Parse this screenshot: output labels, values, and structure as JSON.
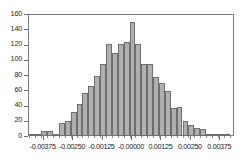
{
  "chart_data": {
    "type": "bar",
    "title": "",
    "subtitle": "",
    "xlabel": "",
    "ylabel": "",
    "xlim": [
      -0.004375,
      0.004375
    ],
    "ylim": [
      0,
      160
    ],
    "grid": false,
    "legend": null,
    "bar_color": "#b0b0b0",
    "bar_edge_color": "#6e6e6e",
    "axis_color": "#7a7a7a",
    "text_color": "#1a1a1a",
    "background": "#ffffff",
    "y_ticks": [
      0,
      20,
      40,
      60,
      80,
      100,
      120,
      140,
      160
    ],
    "y_tick_labels": [
      "0",
      "20",
      "40",
      "60",
      "80",
      "100",
      "120",
      "140",
      "160"
    ],
    "x_ticks": [
      -0.00375,
      -0.0025,
      -0.00125,
      -0.0,
      0.00125,
      0.0025,
      0.00375
    ],
    "x_tick_labels": [
      "-0.00375",
      "-0.00250",
      "-0.00125",
      "-0.00000",
      "0.00125",
      "0.00250",
      "0.00375"
    ],
    "bin_width": 0.00025,
    "bin_centers": [
      -0.0041875,
      -0.0039375,
      -0.0036875,
      -0.0034375,
      -0.0031875,
      -0.0029375,
      -0.0026875,
      -0.0024375,
      -0.0021875,
      -0.0019375,
      -0.0016875,
      -0.0014375,
      -0.0011875,
      -0.0009375,
      -0.0006875,
      -0.0004375,
      -0.0001875,
      6.25e-05,
      0.0003125,
      0.0005625,
      0.0008125,
      0.0010625,
      0.0013125,
      0.0015625,
      0.0018125,
      0.0020625,
      0.0023125,
      0.0025625,
      0.0028125,
      0.0030625,
      0.0033125,
      0.0035625,
      0.0038125,
      0.0040625
    ],
    "categories": [
      "-0.0041875",
      "-0.0039375",
      "-0.0036875",
      "-0.0034375",
      "-0.0031875",
      "-0.0029375",
      "-0.0026875",
      "-0.0024375",
      "-0.0021875",
      "-0.0019375",
      "-0.0016875",
      "-0.0014375",
      "-0.0011875",
      "-0.0009375",
      "-0.0006875",
      "-0.0004375",
      "-0.0001875",
      "0.0000625",
      "0.0003125",
      "0.0005625",
      "0.0008125",
      "0.0010625",
      "0.0013125",
      "0.0015625",
      "0.0018125",
      "0.0020625",
      "0.0023125",
      "0.0025625",
      "0.0028125",
      "0.0030625",
      "0.0033125",
      "0.0035625",
      "0.0038125",
      "0.0040625"
    ],
    "values": [
      1,
      1,
      7,
      7,
      3,
      17,
      20,
      31,
      42,
      57,
      66,
      79,
      94,
      121,
      109,
      121,
      123,
      150,
      121,
      95,
      95,
      78,
      69,
      59,
      37,
      38,
      20,
      15,
      10,
      9,
      1,
      1,
      1,
      2
    ]
  }
}
